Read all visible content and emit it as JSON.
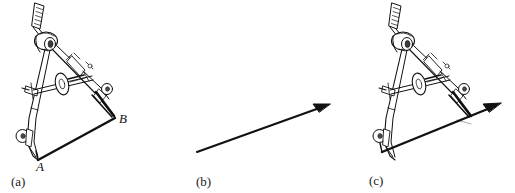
{
  "figure": {
    "background_color": "#ffffff",
    "ink_color": "#000000",
    "line_color": "#1a1a1a",
    "width": 515,
    "height": 193
  },
  "panels": [
    {
      "id": "a",
      "caption": "(a)",
      "description": "compass-with-vector-AB",
      "point_labels": [
        {
          "name": "A",
          "text": "A",
          "x": 38,
          "y": 160
        },
        {
          "name": "B",
          "text": "B",
          "x": 116,
          "y": 118
        }
      ],
      "vector": {
        "from_label": "A",
        "to_label": "B",
        "has_arrowhead": false
      }
    },
    {
      "id": "b",
      "caption": "(b)",
      "description": "free-vector-arrow",
      "point_labels": [],
      "vector": {
        "from_label": "",
        "to_label": "",
        "has_arrowhead": true
      }
    },
    {
      "id": "c",
      "caption": "(c)",
      "description": "compass-measuring-along-vector",
      "point_labels": [],
      "vector": {
        "from_label": "",
        "to_label": "",
        "has_arrowhead": true
      }
    }
  ],
  "compass": {
    "name": "drafting-compass",
    "parts": [
      "handle-knob",
      "hinge-joint",
      "left-leg",
      "right-leg",
      "adjustment-crossbar",
      "thumb-wheel",
      "needle-point",
      "pen-point"
    ]
  }
}
